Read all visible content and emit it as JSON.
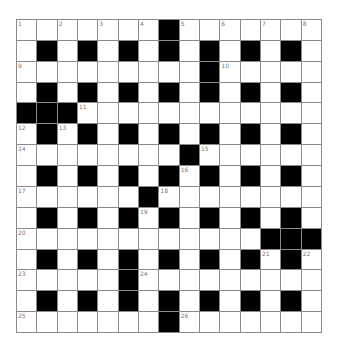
{
  "puzzle": {
    "rows": 15,
    "cols": 15,
    "colors": {
      "block": "#000000",
      "cell": "#ffffff",
      "grid_line": "#8a8a8a",
      "number": "#777777"
    },
    "layout": [
      "WWWWWWWBWWWWWWW",
      "WBWBWBWBWBWBWBW",
      "WWWWWWWWWBWWWWW",
      "WBWBWBWBWBWBWBW",
      "BBBWWWWWWWWWWWW",
      "WBWBWBWBWBWBWBW",
      "WWWWWWWWBWWWWWW",
      "WBWBWBWBWBWBWBW",
      "WWWWWWBWWWWWWWW",
      "WBWBWBWBWBWBWBW",
      "WWWWWWWWWWWWBBB",
      "WBWBWBWBWBWBWBW",
      "WWWWWBWWWWWWWWW",
      "WBWBWBWBWBWBWBW",
      "WWWWWWWBWWWWWWW"
    ],
    "numbers": [
      {
        "row": 0,
        "col": 0,
        "n": "1"
      },
      {
        "row": 0,
        "col": 2,
        "n": "2"
      },
      {
        "row": 0,
        "col": 4,
        "n": "3"
      },
      {
        "row": 0,
        "col": 6,
        "n": "4"
      },
      {
        "row": 0,
        "col": 8,
        "n": "5"
      },
      {
        "row": 0,
        "col": 10,
        "n": "6"
      },
      {
        "row": 0,
        "col": 12,
        "n": "7"
      },
      {
        "row": 0,
        "col": 14,
        "n": "8"
      },
      {
        "row": 2,
        "col": 0,
        "n": "9"
      },
      {
        "row": 2,
        "col": 10,
        "n": "10"
      },
      {
        "row": 4,
        "col": 3,
        "n": "11"
      },
      {
        "row": 5,
        "col": 0,
        "n": "12"
      },
      {
        "row": 5,
        "col": 2,
        "n": "13"
      },
      {
        "row": 6,
        "col": 0,
        "n": "14"
      },
      {
        "row": 6,
        "col": 9,
        "n": "15"
      },
      {
        "row": 7,
        "col": 8,
        "n": "16"
      },
      {
        "row": 8,
        "col": 0,
        "n": "17"
      },
      {
        "row": 8,
        "col": 7,
        "n": "18"
      },
      {
        "row": 9,
        "col": 6,
        "n": "19"
      },
      {
        "row": 10,
        "col": 0,
        "n": "20"
      },
      {
        "row": 11,
        "col": 12,
        "n": "21"
      },
      {
        "row": 11,
        "col": 14,
        "n": "22"
      },
      {
        "row": 12,
        "col": 0,
        "n": "23"
      },
      {
        "row": 12,
        "col": 6,
        "n": "24"
      },
      {
        "row": 14,
        "col": 0,
        "n": "25"
      },
      {
        "row": 14,
        "col": 8,
        "n": "26"
      }
    ]
  }
}
